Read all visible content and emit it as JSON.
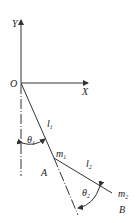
{
  "diagram": {
    "axes": {
      "x_label": "X",
      "y_label": "Y",
      "origin_label": "O"
    },
    "links": [
      {
        "name": "l",
        "sub": "1",
        "mass": "m",
        "mass_sub": "1",
        "joint": "A",
        "angle": "θ",
        "angle_sub": "1"
      },
      {
        "name": "l",
        "sub": "2",
        "mass": "m",
        "mass_sub": "2",
        "joint": "B",
        "angle": "θ",
        "angle_sub": "2"
      }
    ]
  }
}
